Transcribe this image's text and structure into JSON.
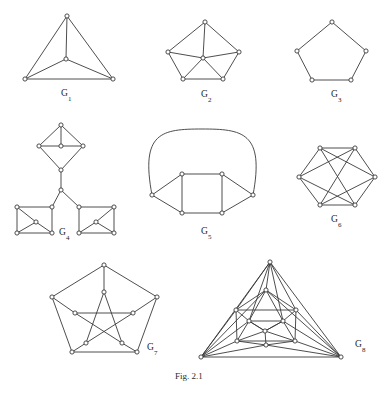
{
  "figure": {
    "caption": "Fig. 2.1",
    "caption_x": 175,
    "caption_y": 379,
    "background": "#ffffff",
    "ink_color": "#3a3a3a",
    "vertex_radius": 2.1,
    "vertex_fill": "#ffffff"
  },
  "graphs": [
    {
      "id": "G1",
      "name": "graph-g1",
      "label": "G",
      "subscript": "1",
      "label_x": 61,
      "label_y": 94,
      "description": "complete graph K4 drawn as triangle with interior vertex",
      "vertices": [
        {
          "name": "apex",
          "x": 67,
          "y": 16
        },
        {
          "name": "center",
          "x": 66,
          "y": 59
        },
        {
          "name": "bottom-left",
          "x": 25,
          "y": 79
        },
        {
          "name": "bottom-right",
          "x": 113,
          "y": 79
        }
      ],
      "edges": [
        [
          0,
          1
        ],
        [
          0,
          2
        ],
        [
          0,
          3
        ],
        [
          1,
          2
        ],
        [
          1,
          3
        ],
        [
          2,
          3
        ]
      ],
      "arcs": []
    },
    {
      "id": "G2",
      "name": "graph-g2",
      "label": "G",
      "subscript": "2",
      "label_x": 201,
      "label_y": 95,
      "description": "wheel W5: pentagon rim with hub joined to all rim vertices",
      "vertices": [
        {
          "name": "rim-top",
          "x": 205,
          "y": 22
        },
        {
          "name": "rim-right",
          "x": 239,
          "y": 52
        },
        {
          "name": "rim-bottom-right",
          "x": 223,
          "y": 79
        },
        {
          "name": "rim-bottom-left",
          "x": 183,
          "y": 79
        },
        {
          "name": "rim-left",
          "x": 168,
          "y": 52
        },
        {
          "name": "hub",
          "x": 203,
          "y": 58
        }
      ],
      "edges": [
        [
          0,
          1
        ],
        [
          1,
          2
        ],
        [
          2,
          3
        ],
        [
          3,
          4
        ],
        [
          4,
          0
        ],
        [
          5,
          0
        ],
        [
          5,
          1
        ],
        [
          5,
          2
        ],
        [
          5,
          3
        ],
        [
          5,
          4
        ]
      ],
      "arcs": []
    },
    {
      "id": "G3",
      "name": "graph-g3",
      "label": "G",
      "subscript": "3",
      "label_x": 331,
      "label_y": 95,
      "description": "cycle C5, plain pentagon",
      "vertices": [
        {
          "name": "top",
          "x": 332,
          "y": 22
        },
        {
          "name": "right",
          "x": 366,
          "y": 51
        },
        {
          "name": "bottom-right",
          "x": 351,
          "y": 80
        },
        {
          "name": "bottom-left",
          "x": 312,
          "y": 80
        },
        {
          "name": "left",
          "x": 297,
          "y": 51
        }
      ],
      "edges": [
        [
          0,
          1
        ],
        [
          1,
          2
        ],
        [
          2,
          3
        ],
        [
          3,
          4
        ],
        [
          4,
          0
        ]
      ],
      "arcs": []
    },
    {
      "id": "G4",
      "name": "graph-g4",
      "label": "G",
      "subscript": "4",
      "label_x": 59,
      "label_y": 233,
      "description": "tree-like arrangement: top diamond with interior vertex, cut vertex, two squares each with interior vertex",
      "vertices": [
        {
          "name": "diamond-top",
          "x": 61,
          "y": 125
        },
        {
          "name": "diamond-left",
          "x": 39,
          "y": 146
        },
        {
          "name": "diamond-right",
          "x": 83,
          "y": 146
        },
        {
          "name": "diamond-center",
          "x": 61,
          "y": 146
        },
        {
          "name": "diamond-bottom",
          "x": 61,
          "y": 170
        },
        {
          "name": "junction",
          "x": 61,
          "y": 190
        },
        {
          "name": "left-sq-tl",
          "x": 17,
          "y": 207
        },
        {
          "name": "left-sq-tr",
          "x": 52,
          "y": 207
        },
        {
          "name": "left-sq-br",
          "x": 52,
          "y": 233
        },
        {
          "name": "left-sq-bl",
          "x": 17,
          "y": 233
        },
        {
          "name": "left-sq-center",
          "x": 36,
          "y": 222
        },
        {
          "name": "right-sq-tl",
          "x": 79,
          "y": 207
        },
        {
          "name": "right-sq-tr",
          "x": 114,
          "y": 207
        },
        {
          "name": "right-sq-br",
          "x": 114,
          "y": 233
        },
        {
          "name": "right-sq-bl",
          "x": 79,
          "y": 233
        },
        {
          "name": "right-sq-center",
          "x": 96,
          "y": 222
        }
      ],
      "edges": [
        [
          0,
          1
        ],
        [
          0,
          2
        ],
        [
          1,
          4
        ],
        [
          2,
          4
        ],
        [
          0,
          3
        ],
        [
          1,
          3
        ],
        [
          2,
          3
        ],
        [
          4,
          5
        ],
        [
          5,
          7
        ],
        [
          5,
          11
        ],
        [
          6,
          7
        ],
        [
          7,
          8
        ],
        [
          8,
          9
        ],
        [
          9,
          6
        ],
        [
          10,
          6
        ],
        [
          10,
          9
        ],
        [
          10,
          8
        ],
        [
          11,
          12
        ],
        [
          12,
          13
        ],
        [
          13,
          14
        ],
        [
          14,
          11
        ],
        [
          15,
          12
        ],
        [
          15,
          14
        ],
        [
          15,
          13
        ]
      ],
      "arcs": []
    },
    {
      "id": "G5",
      "name": "graph-g5",
      "label": "G",
      "subscript": "5",
      "label_x": 201,
      "label_y": 232,
      "description": "square with two pendant side vertices joined by a large arc over the top",
      "vertices": [
        {
          "name": "sq-top-left",
          "x": 182,
          "y": 174
        },
        {
          "name": "sq-top-right",
          "x": 222,
          "y": 174
        },
        {
          "name": "sq-bottom-right",
          "x": 222,
          "y": 213
        },
        {
          "name": "sq-bottom-left",
          "x": 182,
          "y": 213
        },
        {
          "name": "left-outer",
          "x": 152,
          "y": 195
        },
        {
          "name": "right-outer",
          "x": 253,
          "y": 195
        }
      ],
      "edges": [
        [
          0,
          1
        ],
        [
          1,
          2
        ],
        [
          2,
          3
        ],
        [
          3,
          0
        ],
        [
          4,
          0
        ],
        [
          4,
          3
        ],
        [
          5,
          1
        ],
        [
          5,
          2
        ]
      ],
      "arcs": [
        {
          "name": "top-arc",
          "from": 4,
          "to": 5,
          "path": "M152,195 C140,132 162,129 202,129 C242,129 265,132 253,195"
        }
      ]
    },
    {
      "id": "G6",
      "name": "graph-g6",
      "label": "G",
      "subscript": "6",
      "label_x": 331,
      "label_y": 220,
      "description": "hexagon with three long diagonals forming crossing triangles",
      "vertices": [
        {
          "name": "top-left",
          "x": 320,
          "y": 148
        },
        {
          "name": "top-right",
          "x": 355,
          "y": 148
        },
        {
          "name": "right",
          "x": 375,
          "y": 177
        },
        {
          "name": "bottom-right",
          "x": 355,
          "y": 205
        },
        {
          "name": "bottom-left",
          "x": 320,
          "y": 205
        },
        {
          "name": "left",
          "x": 299,
          "y": 177
        }
      ],
      "edges": [
        [
          0,
          1
        ],
        [
          1,
          2
        ],
        [
          2,
          3
        ],
        [
          3,
          4
        ],
        [
          4,
          5
        ],
        [
          5,
          0
        ],
        [
          5,
          1
        ],
        [
          5,
          3
        ],
        [
          0,
          3
        ],
        [
          1,
          4
        ],
        [
          2,
          0
        ],
        [
          2,
          4
        ]
      ],
      "arcs": []
    },
    {
      "id": "G7",
      "name": "graph-g7",
      "label": "G",
      "subscript": "7",
      "label_x": 147,
      "label_y": 348,
      "description": "Petersen graph: outer pentagon, inner pentagram, five spokes",
      "vertices": [
        {
          "name": "outer-top",
          "x": 104,
          "y": 265
        },
        {
          "name": "outer-right",
          "x": 157,
          "y": 297
        },
        {
          "name": "outer-bottom-right",
          "x": 137,
          "y": 352
        },
        {
          "name": "outer-bottom-left",
          "x": 72,
          "y": 352
        },
        {
          "name": "outer-left",
          "x": 52,
          "y": 297
        },
        {
          "name": "inner-top",
          "x": 104,
          "y": 292
        },
        {
          "name": "inner-right",
          "x": 133,
          "y": 313
        },
        {
          "name": "inner-bottom-right",
          "x": 122,
          "y": 343
        },
        {
          "name": "inner-bottom-left",
          "x": 86,
          "y": 343
        },
        {
          "name": "inner-left",
          "x": 75,
          "y": 313
        }
      ],
      "edges": [
        [
          0,
          1
        ],
        [
          1,
          2
        ],
        [
          2,
          3
        ],
        [
          3,
          4
        ],
        [
          4,
          0
        ],
        [
          0,
          5
        ],
        [
          1,
          6
        ],
        [
          2,
          7
        ],
        [
          3,
          8
        ],
        [
          4,
          9
        ],
        [
          5,
          7
        ],
        [
          7,
          9
        ],
        [
          9,
          6
        ],
        [
          6,
          8
        ],
        [
          8,
          5
        ]
      ],
      "arcs": []
    },
    {
      "id": "G8",
      "name": "graph-g8",
      "label": "G",
      "subscript": "8",
      "label_x": 355,
      "label_y": 345,
      "description": "triangulated triangle: apex and two base corners joined to a nested triangulated core",
      "vertices": [
        {
          "name": "apex",
          "x": 270,
          "y": 262
        },
        {
          "name": "base-left",
          "x": 201,
          "y": 357
        },
        {
          "name": "base-right",
          "x": 341,
          "y": 357
        },
        {
          "name": "core-top",
          "x": 266,
          "y": 290
        },
        {
          "name": "core-left",
          "x": 236,
          "y": 310
        },
        {
          "name": "core-right",
          "x": 296,
          "y": 310
        },
        {
          "name": "core-mid-left",
          "x": 249,
          "y": 321
        },
        {
          "name": "core-mid-right",
          "x": 283,
          "y": 321
        },
        {
          "name": "core-inner",
          "x": 265,
          "y": 331
        },
        {
          "name": "core-bot-left",
          "x": 237,
          "y": 341
        },
        {
          "name": "core-bot-right",
          "x": 295,
          "y": 341
        },
        {
          "name": "core-bottom",
          "x": 266,
          "y": 345
        }
      ],
      "edges": [
        [
          0,
          1
        ],
        [
          0,
          2
        ],
        [
          1,
          2
        ],
        [
          0,
          3
        ],
        [
          0,
          4
        ],
        [
          0,
          5
        ],
        [
          0,
          6
        ],
        [
          0,
          7
        ],
        [
          1,
          4
        ],
        [
          1,
          6
        ],
        [
          1,
          9
        ],
        [
          1,
          11
        ],
        [
          1,
          3
        ],
        [
          2,
          5
        ],
        [
          2,
          7
        ],
        [
          2,
          10
        ],
        [
          2,
          11
        ],
        [
          2,
          3
        ],
        [
          3,
          4
        ],
        [
          3,
          5
        ],
        [
          3,
          6
        ],
        [
          3,
          7
        ],
        [
          4,
          5
        ],
        [
          4,
          6
        ],
        [
          4,
          9
        ],
        [
          5,
          7
        ],
        [
          5,
          10
        ],
        [
          6,
          7
        ],
        [
          6,
          8
        ],
        [
          6,
          9
        ],
        [
          7,
          8
        ],
        [
          7,
          10
        ],
        [
          8,
          9
        ],
        [
          8,
          10
        ],
        [
          8,
          11
        ],
        [
          8,
          6
        ],
        [
          8,
          7
        ],
        [
          9,
          11
        ],
        [
          10,
          11
        ],
        [
          9,
          10
        ]
      ],
      "arcs": []
    }
  ]
}
